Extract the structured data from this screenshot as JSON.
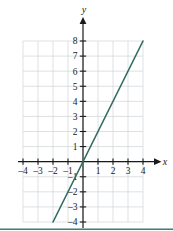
{
  "figure": {
    "background_color": "#ffffff",
    "footer_rule_color": "#3f7c72"
  },
  "chart_data": {
    "type": "line",
    "title": "",
    "subtitle": "",
    "xlabel": "x",
    "ylabel": "y",
    "grid": true,
    "grid_color": "#cfd4d8",
    "axis_color": "#1a1a1a",
    "legend": null,
    "legend_position": "none",
    "xlim": [
      -4,
      4
    ],
    "ylim": [
      -4,
      8
    ],
    "xticks": [
      -4,
      -3,
      -2,
      -1,
      1,
      2,
      3,
      4
    ],
    "yticks": [
      -4,
      -3,
      -2,
      -1,
      1,
      2,
      3,
      4,
      5,
      6,
      7,
      8
    ],
    "xtick_labels": [
      "–4",
      "–3",
      "–2",
      "–1",
      "1",
      "2",
      "3",
      "4"
    ],
    "ytick_labels": [
      "–4",
      "–3",
      "–2",
      "–1",
      "1",
      "2",
      "3",
      "4",
      "5",
      "6",
      "7",
      "8"
    ],
    "series": [
      {
        "name": "y = 2x",
        "color": "#2f6b60",
        "equation": "y = 2x",
        "slope": 2,
        "intercept": 0,
        "points": [
          {
            "x": -2,
            "y": -4
          },
          {
            "x": 4,
            "y": 8
          }
        ]
      }
    ],
    "annotations": []
  }
}
